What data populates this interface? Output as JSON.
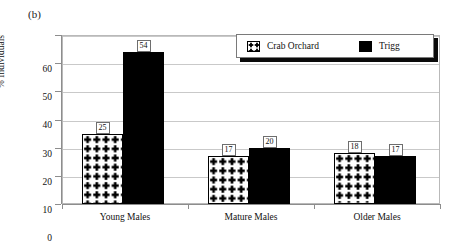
{
  "panel": {
    "label": "(b)"
  },
  "chart_data": {
    "type": "bar",
    "title": "",
    "subtitle": "",
    "xlabel": "",
    "ylabel": "% Individuals",
    "ylim": [
      0,
      60
    ],
    "yticks": [
      0,
      10,
      20,
      30,
      40,
      50,
      60
    ],
    "ytick_labels": [
      "0",
      "10",
      "20",
      "30",
      "40",
      "50",
      "60"
    ],
    "grid": "horizontal",
    "legend_position": "upper-right-inside",
    "categories": [
      "Young Males",
      "Mature Males",
      "Older Males"
    ],
    "series": [
      {
        "name": "Crab Orchard",
        "pattern": "plus-sign-hatch",
        "color": "#000000",
        "fill": "#ffffff",
        "values": [
          25,
          17,
          18
        ]
      },
      {
        "name": "Trigg",
        "pattern": "solid",
        "color": "#000000",
        "fill": "#000000",
        "values": [
          54,
          20,
          17
        ]
      }
    ],
    "data_labels": [
      {
        "series": "Crab Orchard",
        "category": "Young Males",
        "value": "25"
      },
      {
        "series": "Trigg",
        "category": "Young Males",
        "value": "54"
      },
      {
        "series": "Crab Orchard",
        "category": "Mature Males",
        "value": "17"
      },
      {
        "series": "Trigg",
        "category": "Mature Males",
        "value": "20"
      },
      {
        "series": "Crab Orchard",
        "category": "Older Males",
        "value": "18"
      },
      {
        "series": "Trigg",
        "category": "Older Males",
        "value": "17"
      }
    ]
  },
  "legend": {
    "entries": [
      {
        "label": "Crab Orchard",
        "swatch": "plus-hatch-swatch"
      },
      {
        "label": "Trigg",
        "swatch": "solid-black-swatch"
      }
    ]
  },
  "axis": {
    "y": {
      "labels": [
        "60",
        "50",
        "40",
        "30",
        "20",
        "10",
        "0"
      ]
    },
    "x": {
      "labels": [
        "Young Males",
        "Mature Males",
        "Older Males"
      ]
    }
  },
  "colors": {
    "bar_solid": "#000000",
    "bar_pattern_fg": "#000000",
    "bar_pattern_bg": "#ffffff",
    "gridline": "#c9c9c9",
    "axis": "#8d8d8d",
    "plot_border": "#b9b9b9",
    "legend_shadow": "#0a0a0a",
    "text": "#111111"
  }
}
